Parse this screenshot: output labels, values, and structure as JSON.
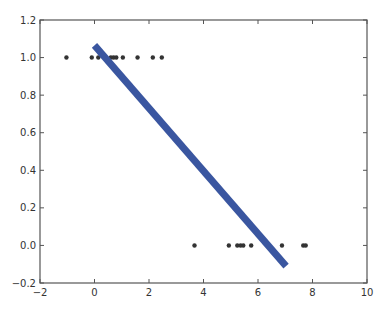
{
  "chart_data": {
    "type": "scatter",
    "title": "",
    "xlabel": "",
    "ylabel": "",
    "xlim": [
      -2,
      10
    ],
    "ylim": [
      -0.2,
      1.2
    ],
    "xticks": [
      -2,
      0,
      2,
      4,
      6,
      8,
      10
    ],
    "xtick_labels": [
      "−2",
      "0",
      "2",
      "4",
      "6",
      "8",
      "10"
    ],
    "yticks": [
      -0.2,
      0.0,
      0.2,
      0.4,
      0.6,
      0.8,
      1.0,
      1.2
    ],
    "ytick_labels": [
      "−0.2",
      "0.0",
      "0.2",
      "0.4",
      "0.6",
      "0.8",
      "1.0",
      "1.2"
    ],
    "grid": false,
    "legend": null,
    "series": [
      {
        "name": "data points",
        "type": "scatter",
        "color": "#333333",
        "x": [
          -1.03,
          -0.1,
          0.14,
          0.6,
          0.7,
          0.8,
          1.04,
          1.58,
          2.14,
          2.47,
          3.67,
          4.93,
          5.24,
          5.36,
          5.46,
          5.75,
          6.88,
          7.66,
          7.75
        ],
        "y": [
          1,
          1,
          1,
          1,
          1,
          1,
          1,
          1,
          1,
          1,
          0,
          0,
          0,
          0,
          0,
          0,
          0,
          0,
          0
        ]
      },
      {
        "name": "fit line",
        "type": "line",
        "color": "#3a56a0",
        "linewidth": 7,
        "x": [
          0.0,
          7.03
        ],
        "y": [
          1.065,
          -0.11
        ]
      }
    ]
  }
}
